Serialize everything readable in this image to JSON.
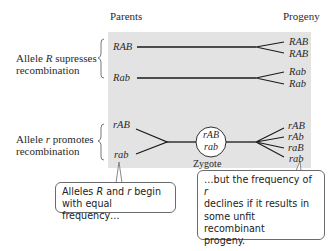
{
  "headers": {
    "parents": "Parents",
    "progeny": "Progeny"
  },
  "groups": [
    {
      "label_line1_pre": "Allele ",
      "label_allele": "R",
      "label_line1_post": " supresses",
      "label_line2": "recombination",
      "parents": [
        "RAB",
        "Rab"
      ],
      "progeny": [
        "RAB",
        "RAB",
        "Rab",
        "Rab"
      ]
    },
    {
      "label_line1_pre": "Allele ",
      "label_allele": "r",
      "label_line1_post": " promotes",
      "label_line2": "recombination",
      "parents": [
        "rAB",
        "rab"
      ],
      "zygote": {
        "top": "rAB",
        "bottom": "rab",
        "label": "Zygote"
      },
      "progeny": [
        "rAB",
        "rAb",
        "raB",
        "rab"
      ]
    }
  ],
  "callouts": [
    {
      "pre": "Alleles ",
      "a1": "R",
      "mid": " and ",
      "a2": "r",
      "post": " begin",
      "line2": "with equal frequency…"
    },
    {
      "line1_pre": "…but the frequency of ",
      "allele": "r",
      "line2": "declines if it results in",
      "line3": "some unfit recombinant",
      "line4": "progeny."
    }
  ],
  "colors": {
    "panel": "#e3e3e3",
    "line": "#1a1a1a",
    "callout_border": "#6b6b6b"
  }
}
